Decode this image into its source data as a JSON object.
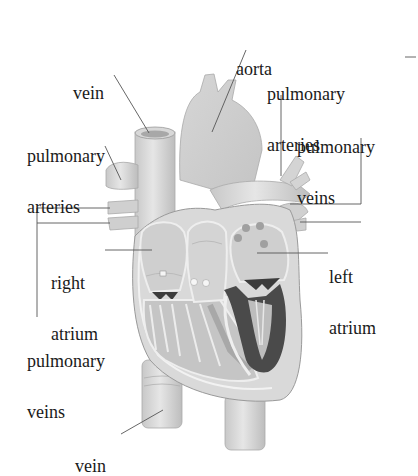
{
  "diagram": {
    "colors": {
      "background": "#ffffff",
      "tissue_light": "#dcdcdc",
      "tissue_mid": "#b9b9b9",
      "tissue_dark": "#4a4a4a",
      "leader_line": "#555555",
      "text": "#1a1a1a"
    },
    "labels": {
      "vein_top": {
        "lines": [
          "vein"
        ]
      },
      "pulmonary_arteries_left": {
        "lines": [
          "pulmonary",
          "arteries"
        ]
      },
      "aorta": {
        "lines": [
          "aorta"
        ]
      },
      "pulmonary_arteries_right": {
        "lines": [
          "pulmonary",
          "arteries"
        ]
      },
      "pulmonary_veins_right": {
        "lines": [
          "pulmonary",
          "veins"
        ]
      },
      "right_atrium": {
        "lines": [
          "right",
          "atrium"
        ]
      },
      "left_atrium": {
        "lines": [
          "left",
          "atrium"
        ]
      },
      "pulmonary_veins_left": {
        "lines": [
          "pulmonary",
          "veins"
        ]
      },
      "vein_bottom": {
        "lines": [
          "vein"
        ]
      }
    }
  }
}
